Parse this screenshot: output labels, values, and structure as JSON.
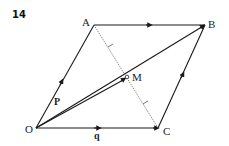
{
  "figure": {
    "number": "14",
    "points": {
      "O": {
        "label": "O",
        "x": 36,
        "y": 128
      },
      "A": {
        "label": "A",
        "x": 94,
        "y": 25
      },
      "B": {
        "label": "B",
        "x": 205,
        "y": 25
      },
      "C": {
        "label": "C",
        "x": 158,
        "y": 128
      },
      "M": {
        "label": "M",
        "x": 127,
        "y": 77
      }
    },
    "vectors": {
      "p": "P",
      "q": "q"
    },
    "colors": {
      "line": "#1a1a1a",
      "dotted": "#555555",
      "background": "#ffffff"
    }
  }
}
